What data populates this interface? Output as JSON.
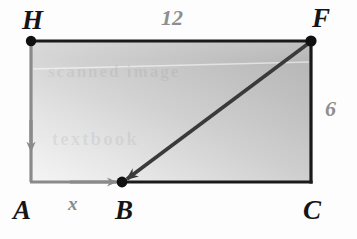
{
  "diagram": {
    "type": "rectangle-with-vector-path",
    "vertices": [
      {
        "id": "H",
        "label": "H",
        "x": 31,
        "y": 41,
        "dot": true
      },
      {
        "id": "F",
        "label": "F",
        "x": 311,
        "y": 41,
        "dot": true
      },
      {
        "id": "C",
        "label": "C",
        "x": 311,
        "y": 182,
        "dot": false
      },
      {
        "id": "A",
        "label": "A",
        "x": 31,
        "y": 182,
        "dot": false
      },
      {
        "id": "B",
        "label": "B",
        "x": 122,
        "y": 182,
        "dot": true
      }
    ],
    "measurements": [
      {
        "id": "top",
        "label": "12",
        "edge": "HF",
        "color": "#8e8e8e"
      },
      {
        "id": "right",
        "label": "6",
        "edge": "FC",
        "color": "#8e8e8e"
      },
      {
        "id": "seg",
        "label": "x",
        "edge": "AB",
        "color": "#8a8a8a"
      }
    ],
    "vectors": [
      {
        "id": "vector-HA",
        "from": "H",
        "to": "A",
        "color": "#8a8a8a",
        "arrowhead": "mid"
      },
      {
        "id": "vector-AB",
        "from": "A",
        "to": "B",
        "color": "#8a8a8a",
        "arrowhead": "end"
      },
      {
        "id": "vector-FB",
        "from": "F",
        "to": "B",
        "color": "#3a3a3a",
        "arrowhead": "end"
      }
    ],
    "colors": {
      "outline": "#1a1a1a",
      "vector_gray": "#8a8a8a",
      "vector_dark": "#3a3a3a",
      "fill_light": "#f2f2f2",
      "fill_dark": "#b4b4b4",
      "label_dark": "#151515",
      "label_gray": "#8e8e8e",
      "background": "#fdfdfd"
    },
    "watermark": {
      "line1": "scanned image",
      "line2": "textbook"
    }
  }
}
